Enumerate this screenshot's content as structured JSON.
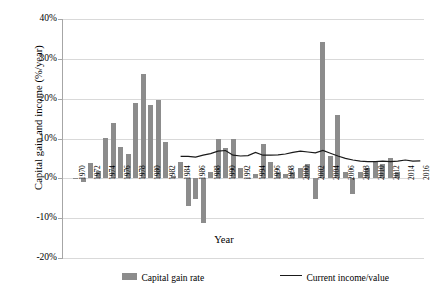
{
  "axes": {
    "ylabel": "Capital gain and income  (%/year)",
    "xlabel": "Year",
    "yticks": [
      "40%",
      "30%",
      "20%",
      "10%",
      "0%",
      "-10%",
      "-20%"
    ]
  },
  "legend": {
    "bar_label": "Capital gain rate",
    "line_label": "Current income/value",
    "bar_color": "#8c8c8c",
    "line_color": "#1a1a1a"
  },
  "chart_data": {
    "type": "bar",
    "title": "",
    "xlabel": "Year",
    "ylabel": "Capital gain and income  (%/year)",
    "ylim": [
      -20,
      40
    ],
    "ytick_values": [
      40,
      30,
      20,
      10,
      0,
      -10,
      -20
    ],
    "grid": true,
    "legend_position": "bottom",
    "categories": [
      1970,
      1971,
      1972,
      1973,
      1974,
      1975,
      1976,
      1977,
      1978,
      1979,
      1980,
      1981,
      1982,
      1983,
      1984,
      1985,
      1986,
      1987,
      1988,
      1989,
      1990,
      1991,
      1992,
      1993,
      1994,
      1995,
      1996,
      1997,
      1998,
      1999,
      2000,
      2001,
      2002,
      2003,
      2004,
      2005,
      2006,
      2007,
      2008,
      2009,
      2010,
      2011,
      2012,
      2013,
      2014,
      2015,
      2016
    ],
    "xtick_labels": [
      "1970",
      "1972",
      "1974",
      "1976",
      "1978",
      "1980",
      "1982",
      "1984",
      "1986",
      "1988",
      "1990",
      "1992",
      "1994",
      "1996",
      "1998",
      "2000",
      "2002",
      "2004",
      "2006",
      "2008",
      "2010",
      "2012",
      "2014",
      "2016"
    ],
    "series": [
      {
        "name": "Capital gain rate",
        "type": "bar",
        "color": "#8c8c8c",
        "values": [
          0.2,
          -1.0,
          3.8,
          1.8,
          10.2,
          14.0,
          8.0,
          6.2,
          18.8,
          26.2,
          18.4,
          19.6,
          9.2,
          0.6,
          4.0,
          -7.0,
          -5.2,
          -11.2,
          1.6,
          10.0,
          7.6,
          10.0,
          2.6,
          0.2,
          1.0,
          8.6,
          4.0,
          1.6,
          1.0,
          1.6,
          2.6,
          3.6,
          -5.2,
          34.2,
          5.6,
          16.0,
          1.6,
          -4.0,
          1.6,
          2.6,
          4.2,
          3.6,
          5.0,
          1.6,
          0.0,
          0.0,
          0.0
        ]
      },
      {
        "name": "Current income/value",
        "type": "line",
        "color": "#1a1a1a",
        "x": [
          1984,
          1985,
          1986,
          1987,
          1988,
          1989,
          1990,
          1991,
          1992,
          1993,
          1994,
          1995,
          1996,
          1997,
          1998,
          1999,
          2000,
          2001,
          2002,
          2003,
          2004,
          2005,
          2006,
          2007,
          2008,
          2009,
          2010,
          2011,
          2012,
          2013,
          2014,
          2015,
          2016
        ],
        "values": [
          5.5,
          5.5,
          5.3,
          5.8,
          6.2,
          6.8,
          7.0,
          5.8,
          5.6,
          5.7,
          6.5,
          5.8,
          5.8,
          5.9,
          6.1,
          6.5,
          6.8,
          6.6,
          6.4,
          7.0,
          6.3,
          5.6,
          5.0,
          4.6,
          4.3,
          4.2,
          4.2,
          4.3,
          4.2,
          4.3,
          4.6,
          4.3,
          4.4
        ]
      }
    ]
  }
}
